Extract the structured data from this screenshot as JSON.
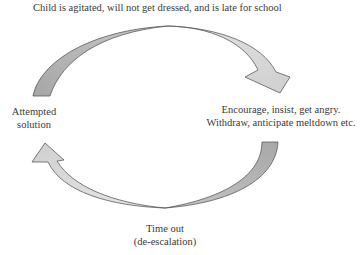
{
  "diagram": {
    "type": "cycle",
    "direction": "clockwise",
    "nodes": {
      "top": {
        "lines": [
          "Child is agitated, will not get dressed, and is late for school"
        ]
      },
      "right": {
        "lines": [
          "Encourage, insist, get angry.",
          "Withdraw, anticipate meltdown etc."
        ]
      },
      "bottom": {
        "lines": [
          "Time out",
          "(de-escalation)"
        ]
      },
      "left": {
        "lines": [
          "Attempted",
          "solution"
        ]
      }
    },
    "edges": [
      {
        "from": "left",
        "to": "right",
        "via": "top",
        "style": "curved-arrow"
      },
      {
        "from": "right",
        "to": "left",
        "via": "bottom",
        "style": "curved-arrow"
      }
    ],
    "colors": {
      "arrow_fill_light": "#d4d4d4",
      "arrow_fill_dark": "#a8a8a8",
      "arrow_stroke": "#5a5a5a",
      "text": "#3a3a3a",
      "background": "#ffffff"
    }
  }
}
